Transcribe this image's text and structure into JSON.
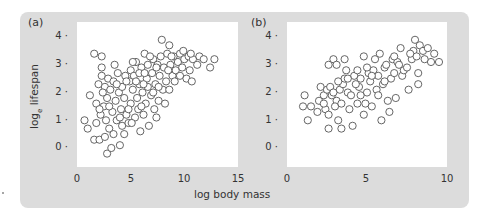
{
  "chart_data": [
    {
      "type": "scatter",
      "panel_label": "(a)",
      "title": "",
      "xlabel": "log body mass",
      "ylabel": "log_e lifespan",
      "xlim": [
        0,
        15
      ],
      "ylim": [
        -0.4,
        4.5
      ],
      "xticks": [
        "0",
        "5",
        "10",
        "15"
      ],
      "yticks": [
        "0",
        "1",
        "2",
        "3",
        "4"
      ],
      "grid": false,
      "legend": null,
      "marker": "open-circle",
      "points": [
        [
          0.7,
          1.0
        ],
        [
          1.2,
          1.9
        ],
        [
          1.0,
          0.7
        ],
        [
          1.6,
          0.3
        ],
        [
          2.1,
          0.3
        ],
        [
          1.6,
          3.4
        ],
        [
          2.3,
          3.3
        ],
        [
          2.3,
          2.9
        ],
        [
          2.0,
          2.3
        ],
        [
          2.3,
          2.6
        ],
        [
          1.8,
          1.6
        ],
        [
          2.2,
          1.2
        ],
        [
          1.8,
          0.9
        ],
        [
          2.5,
          1.5
        ],
        [
          2.8,
          1.8
        ],
        [
          2.6,
          2.2
        ],
        [
          2.9,
          2.5
        ],
        [
          2.7,
          1.0
        ],
        [
          2.6,
          0.4
        ],
        [
          3.0,
          0.7
        ],
        [
          2.8,
          -0.2
        ],
        [
          3.2,
          0.0
        ],
        [
          4.0,
          0.1
        ],
        [
          3.4,
          0.5
        ],
        [
          4.4,
          0.5
        ],
        [
          3.5,
          3.0
        ],
        [
          3.1,
          2.1
        ],
        [
          3.3,
          1.3
        ],
        [
          3.6,
          1.7
        ],
        [
          3.4,
          2.4
        ],
        [
          3.8,
          2.7
        ],
        [
          3.9,
          2.0
        ],
        [
          3.7,
          1.0
        ],
        [
          4.1,
          1.4
        ],
        [
          4.2,
          2.2
        ],
        [
          4.5,
          2.6
        ],
        [
          4.4,
          1.8
        ],
        [
          4.6,
          1.2
        ],
        [
          4.2,
          0.8
        ],
        [
          4.8,
          0.9
        ],
        [
          4.9,
          2.4
        ],
        [
          5.0,
          2.8
        ],
        [
          5.0,
          1.6
        ],
        [
          5.2,
          2.1
        ],
        [
          5.4,
          1.1
        ],
        [
          5.5,
          3.1
        ],
        [
          5.3,
          2.6
        ],
        [
          5.6,
          1.8
        ],
        [
          5.7,
          1.4
        ],
        [
          5.9,
          0.6
        ],
        [
          5.8,
          2.3
        ],
        [
          6.0,
          2.9
        ],
        [
          6.1,
          2.0
        ],
        [
          6.3,
          3.4
        ],
        [
          6.2,
          1.2
        ],
        [
          6.4,
          1.6
        ],
        [
          6.5,
          2.5
        ],
        [
          6.6,
          3.0
        ],
        [
          6.7,
          0.8
        ],
        [
          6.6,
          2.2
        ],
        [
          6.9,
          1.9
        ],
        [
          7.0,
          2.7
        ],
        [
          7.1,
          3.2
        ],
        [
          7.2,
          1.4
        ],
        [
          7.3,
          2.3
        ],
        [
          7.5,
          3.0
        ],
        [
          7.4,
          1.1
        ],
        [
          7.6,
          1.7
        ],
        [
          7.7,
          2.6
        ],
        [
          7.8,
          3.3
        ],
        [
          7.9,
          3.9
        ],
        [
          8.0,
          2.1
        ],
        [
          8.1,
          2.9
        ],
        [
          8.2,
          1.6
        ],
        [
          8.4,
          3.4
        ],
        [
          8.3,
          2.4
        ],
        [
          8.6,
          3.7
        ],
        [
          8.7,
          3.0
        ],
        [
          8.6,
          2.1
        ],
        [
          8.9,
          2.6
        ],
        [
          9.0,
          3.3
        ],
        [
          9.2,
          2.8
        ],
        [
          9.4,
          3.1
        ],
        [
          9.6,
          3.4
        ],
        [
          9.6,
          2.6
        ],
        [
          9.8,
          2.9
        ],
        [
          10.0,
          3.2
        ],
        [
          10.2,
          2.5
        ],
        [
          10.4,
          3.3
        ],
        [
          10.5,
          2.8
        ],
        [
          10.7,
          2.4
        ],
        [
          10.8,
          3.2
        ],
        [
          11.2,
          3.0
        ],
        [
          11.4,
          3.3
        ],
        [
          11.8,
          3.2
        ],
        [
          12.4,
          2.9
        ],
        [
          12.8,
          3.2
        ],
        [
          5.2,
          3.1
        ],
        [
          6.8,
          3.3
        ],
        [
          4.6,
          2.4
        ],
        [
          3.0,
          1.5
        ],
        [
          2.4,
          2.0
        ],
        [
          5.8,
          2.7
        ],
        [
          6.2,
          2.3
        ],
        [
          7.1,
          2.0
        ],
        [
          8.5,
          2.8
        ],
        [
          9.1,
          2.4
        ],
        [
          9.9,
          3.5
        ],
        [
          10.6,
          3.4
        ],
        [
          7.4,
          2.9
        ],
        [
          4.0,
          1.1
        ],
        [
          5.1,
          0.9
        ],
        [
          6.0,
          1.5
        ],
        [
          7.6,
          2.2
        ],
        [
          8.8,
          3.3
        ],
        [
          3.7,
          2.3
        ],
        [
          4.8,
          1.4
        ],
        [
          5.5,
          2.4
        ],
        [
          6.3,
          2.7
        ],
        [
          2.1,
          1.4
        ]
      ]
    },
    {
      "type": "scatter",
      "panel_label": "(b)",
      "title": "",
      "xlabel": "log body mass",
      "ylabel": "",
      "xlim": [
        0,
        10
      ],
      "ylim": [
        -0.4,
        4.5
      ],
      "xticks": [
        "0",
        "5",
        "10"
      ],
      "yticks": [
        "0",
        "1",
        "2",
        "3",
        "4"
      ],
      "grid": false,
      "legend": null,
      "marker": "open-circle",
      "points": [
        [
          1.1,
          1.9
        ],
        [
          1.0,
          1.5
        ],
        [
          1.3,
          1.0
        ],
        [
          1.5,
          1.5
        ],
        [
          1.9,
          1.3
        ],
        [
          2.0,
          1.7
        ],
        [
          2.1,
          2.2
        ],
        [
          2.3,
          1.9
        ],
        [
          2.4,
          1.4
        ],
        [
          2.6,
          1.2
        ],
        [
          2.5,
          2.1
        ],
        [
          2.7,
          2.2
        ],
        [
          2.3,
          1.6
        ],
        [
          2.8,
          1.9
        ],
        [
          2.6,
          0.7
        ],
        [
          3.1,
          1.7
        ],
        [
          3.3,
          2.1
        ],
        [
          3.0,
          1.5
        ],
        [
          3.2,
          1.0
        ],
        [
          3.4,
          0.7
        ],
        [
          2.6,
          3.0
        ],
        [
          2.9,
          3.2
        ],
        [
          3.1,
          3.0
        ],
        [
          3.6,
          3.2
        ],
        [
          3.5,
          2.3
        ],
        [
          3.8,
          2.0
        ],
        [
          3.7,
          2.8
        ],
        [
          3.6,
          2.5
        ],
        [
          3.9,
          1.4
        ],
        [
          4.0,
          1.9
        ],
        [
          4.2,
          2.6
        ],
        [
          4.1,
          0.8
        ],
        [
          4.4,
          2.8
        ],
        [
          4.5,
          2.2
        ],
        [
          4.4,
          1.6
        ],
        [
          4.6,
          2.5
        ],
        [
          4.8,
          1.2
        ],
        [
          4.9,
          1.6
        ],
        [
          5.0,
          2.0
        ],
        [
          5.1,
          2.7
        ],
        [
          4.8,
          3.3
        ],
        [
          5.2,
          2.4
        ],
        [
          5.3,
          1.5
        ],
        [
          5.4,
          2.8
        ],
        [
          5.5,
          3.2
        ],
        [
          5.6,
          2.1
        ],
        [
          5.7,
          2.6
        ],
        [
          5.8,
          3.4
        ],
        [
          5.9,
          1.0
        ],
        [
          6.0,
          2.3
        ],
        [
          6.1,
          2.9
        ],
        [
          6.2,
          3.0
        ],
        [
          6.3,
          1.7
        ],
        [
          6.4,
          1.3
        ],
        [
          6.5,
          2.5
        ],
        [
          6.6,
          3.2
        ],
        [
          6.7,
          2.7
        ],
        [
          6.8,
          1.8
        ],
        [
          6.9,
          3.1
        ],
        [
          7.0,
          3.0
        ],
        [
          7.1,
          3.6
        ],
        [
          7.2,
          2.6
        ],
        [
          7.3,
          2.8
        ],
        [
          7.6,
          2.1
        ],
        [
          7.8,
          3.2
        ],
        [
          7.9,
          3.5
        ],
        [
          8.0,
          3.9
        ],
        [
          8.1,
          3.3
        ],
        [
          8.2,
          2.7
        ],
        [
          8.2,
          2.3
        ],
        [
          8.3,
          3.7
        ],
        [
          8.5,
          3.5
        ],
        [
          8.8,
          3.6
        ],
        [
          9.0,
          3.1
        ],
        [
          9.2,
          3.4
        ],
        [
          9.5,
          3.1
        ],
        [
          8.6,
          3.2
        ],
        [
          7.7,
          3.4
        ],
        [
          5.0,
          2.9
        ],
        [
          4.3,
          2.3
        ],
        [
          3.8,
          2.5
        ],
        [
          2.9,
          2.0
        ],
        [
          3.4,
          1.6
        ],
        [
          5.7,
          1.9
        ],
        [
          6.1,
          2.4
        ],
        [
          4.6,
          1.9
        ],
        [
          5.3,
          2.6
        ],
        [
          6.7,
          3.3
        ],
        [
          7.5,
          2.9
        ],
        [
          3.2,
          2.4
        ]
      ]
    }
  ],
  "figure": {
    "background": "#dcdcdc",
    "plot_background": "#ffffff",
    "marker_stroke": "#555555",
    "text_color": "#333333"
  },
  "labels": {
    "panel_a": "(a)",
    "panel_b": "(b)",
    "ylabel_main": "log",
    "ylabel_sub": "e",
    "ylabel_rest": " lifespan",
    "xlabel": "log body mass",
    "yticks": [
      "4 ·",
      "3 ·",
      "2 ·",
      "1 ·",
      "0 ·"
    ],
    "a_xticks": [
      "0",
      "5",
      "10",
      "15"
    ],
    "b_xticks": [
      "0",
      "5",
      "10"
    ]
  }
}
